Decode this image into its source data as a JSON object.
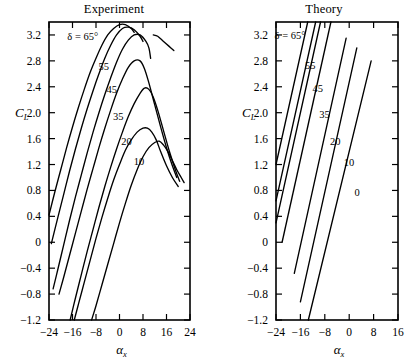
{
  "figure": {
    "background": "#ffffff",
    "ink_color": "#000000"
  },
  "chart_data": [
    {
      "type": "line",
      "title": "Experiment",
      "xlabel": "αₓ",
      "ylabel": "Cₗ",
      "xlabel_base": "α",
      "xlabel_sub": "x",
      "ylabel_base": "C",
      "ylabel_sub": "L",
      "xlim": [
        -24,
        24
      ],
      "ylim": [
        -1.2,
        3.4
      ],
      "xticks": [
        -24,
        -16,
        -8,
        0,
        8,
        16,
        24
      ],
      "xticklabels": [
        "−24",
        "−16",
        "−8",
        "0",
        "8",
        "16",
        "24"
      ],
      "yticks": [
        -1.2,
        -0.8,
        -0.4,
        0,
        0.4,
        0.8,
        1.2,
        1.6,
        2.0,
        2.4,
        2.8,
        3.2
      ],
      "yticklabels": [
        "−1.2",
        "−0.8",
        "−0.4",
        "0",
        "0.4",
        "0.8",
        "1.2",
        "1.6",
        "2.0",
        "2.4",
        "2.8",
        "3.2"
      ],
      "grid": false,
      "legend_position": "inline-annotations",
      "annotation_delta": "δ = 65°",
      "series": [
        {
          "name": "65",
          "label": "δ = 65°",
          "points": [
            [
              -24,
              0.42
            ],
            [
              -22,
              0.78
            ],
            [
              -20,
              1.12
            ],
            [
              -18,
              1.46
            ],
            [
              -16,
              1.78
            ],
            [
              -14,
              2.08
            ],
            [
              -12,
              2.36
            ],
            [
              -10,
              2.62
            ],
            [
              -8,
              2.84
            ],
            [
              -6,
              3.04
            ],
            [
              -4,
              3.2
            ],
            [
              -2,
              3.3
            ],
            [
              0,
              3.36
            ],
            [
              2,
              3.36
            ],
            [
              4,
              3.3
            ],
            [
              5,
              3.24
            ]
          ]
        },
        {
          "name": "55",
          "label": "55",
          "points": [
            [
              -23.2,
              -0.02
            ],
            [
              -21,
              0.38
            ],
            [
              -19,
              0.74
            ],
            [
              -17,
              1.1
            ],
            [
              -15,
              1.44
            ],
            [
              -13,
              1.76
            ],
            [
              -11,
              2.06
            ],
            [
              -9,
              2.34
            ],
            [
              -7,
              2.6
            ],
            [
              -5,
              2.84
            ],
            [
              -3,
              3.04
            ],
            [
              -1,
              3.2
            ],
            [
              1,
              3.3
            ],
            [
              3,
              3.32
            ],
            [
              5,
              3.28
            ],
            [
              7,
              3.18
            ],
            [
              8,
              3.1
            ]
          ]
        },
        {
          "name": "45",
          "label": "45",
          "points": [
            [
              -22.6,
              -0.72
            ],
            [
              -21,
              -0.42
            ],
            [
              -19,
              -0.04
            ],
            [
              -17,
              0.34
            ],
            [
              -15,
              0.7
            ],
            [
              -13,
              1.04
            ],
            [
              -11,
              1.38
            ],
            [
              -9,
              1.7
            ],
            [
              -7,
              2.0
            ],
            [
              -5,
              2.28
            ],
            [
              -3,
              2.54
            ],
            [
              -1,
              2.78
            ],
            [
              1,
              2.98
            ],
            [
              3,
              3.12
            ],
            [
              5,
              3.2
            ],
            [
              7,
              3.2
            ],
            [
              9,
              3.1
            ],
            [
              10,
              3.0
            ],
            [
              10.6,
              2.84
            ]
          ]
        },
        {
          "name": "45b",
          "label": "",
          "points": [
            [
              11.5,
              3.2
            ],
            [
              13,
              3.18
            ],
            [
              15,
              3.1
            ],
            [
              17,
              3.02
            ],
            [
              18.5,
              2.96
            ]
          ]
        },
        {
          "name": "35",
          "label": "35",
          "points": [
            [
              -20.6,
              -0.8
            ],
            [
              -19,
              -0.54
            ],
            [
              -17,
              -0.2
            ],
            [
              -15,
              0.14
            ],
            [
              -13,
              0.48
            ],
            [
              -11,
              0.82
            ],
            [
              -9,
              1.14
            ],
            [
              -7,
              1.46
            ],
            [
              -5,
              1.76
            ],
            [
              -3,
              2.04
            ],
            [
              -1,
              2.3
            ],
            [
              1,
              2.52
            ],
            [
              3,
              2.7
            ],
            [
              5,
              2.8
            ],
            [
              7,
              2.8
            ],
            [
              8.5,
              2.68
            ],
            [
              10,
              2.46
            ],
            [
              12,
              2.12
            ],
            [
              14,
              1.78
            ],
            [
              16,
              1.46
            ],
            [
              18,
              1.18
            ],
            [
              19.5,
              1.0
            ]
          ]
        },
        {
          "name": "20",
          "label": "20",
          "points": [
            [
              -16.8,
              -1.2
            ],
            [
              -15,
              -0.86
            ],
            [
              -13,
              -0.5
            ],
            [
              -11,
              -0.14
            ],
            [
              -9,
              0.2
            ],
            [
              -7,
              0.54
            ],
            [
              -5,
              0.86
            ],
            [
              -3,
              1.16
            ],
            [
              -1,
              1.44
            ],
            [
              1,
              1.7
            ],
            [
              3,
              1.94
            ],
            [
              5,
              2.14
            ],
            [
              7,
              2.3
            ],
            [
              8.5,
              2.38
            ],
            [
              10,
              2.36
            ],
            [
              11.5,
              2.24
            ],
            [
              13,
              2.04
            ],
            [
              15,
              1.72
            ],
            [
              17,
              1.4
            ],
            [
              19,
              1.12
            ],
            [
              20.5,
              0.94
            ]
          ]
        },
        {
          "name": "10",
          "label": "10",
          "points": [
            [
              -15.4,
              -1.2
            ],
            [
              -14,
              -0.96
            ],
            [
              -12,
              -0.62
            ],
            [
              -10,
              -0.28
            ],
            [
              -8,
              0.06
            ],
            [
              -6,
              0.38
            ],
            [
              -4,
              0.68
            ],
            [
              -2,
              0.96
            ],
            [
              0,
              1.2
            ],
            [
              2,
              1.42
            ],
            [
              4,
              1.58
            ],
            [
              6,
              1.7
            ],
            [
              8,
              1.76
            ],
            [
              9.5,
              1.76
            ],
            [
              11,
              1.7
            ],
            [
              12.5,
              1.58
            ],
            [
              14,
              1.4
            ],
            [
              16,
              1.18
            ],
            [
              18,
              1.0
            ],
            [
              20,
              0.86
            ]
          ]
        },
        {
          "name": "0",
          "label": "",
          "points": [
            [
              -9.5,
              -1.2
            ],
            [
              -8,
              -0.98
            ],
            [
              -6,
              -0.66
            ],
            [
              -4,
              -0.34
            ],
            [
              -2,
              -0.02
            ],
            [
              0,
              0.3
            ],
            [
              2,
              0.6
            ],
            [
              4,
              0.88
            ],
            [
              6,
              1.12
            ],
            [
              8,
              1.32
            ],
            [
              10,
              1.46
            ],
            [
              12,
              1.54
            ],
            [
              13.5,
              1.56
            ],
            [
              15,
              1.5
            ],
            [
              16.5,
              1.4
            ],
            [
              18,
              1.26
            ],
            [
              19.5,
              1.12
            ],
            [
              21,
              1.0
            ],
            [
              22,
              0.92
            ]
          ]
        }
      ],
      "curve_labels": [
        {
          "text": "δ = 65°",
          "x": -12.5,
          "y": 3.12
        },
        {
          "text": "55",
          "x": -5.4,
          "y": 2.66
        },
        {
          "text": "45",
          "x": -2.6,
          "y": 2.3
        },
        {
          "text": "35",
          "x": -0.4,
          "y": 1.88
        },
        {
          "text": "20",
          "x": 2.4,
          "y": 1.5
        },
        {
          "text": "10",
          "x": 6.6,
          "y": 1.2
        }
      ]
    },
    {
      "type": "line",
      "title": "Theory",
      "xlabel": "αₓ",
      "ylabel": "Cₗ",
      "xlabel_base": "α",
      "xlabel_sub": "x",
      "ylabel_base": "C",
      "ylabel_sub": "L",
      "xlim": [
        -24,
        16
      ],
      "ylim": [
        -1.2,
        3.4
      ],
      "xticks": [
        -24,
        -16,
        -8,
        0,
        8,
        16
      ],
      "xticklabels": [
        "−24",
        "−16",
        "−8",
        "0",
        "8",
        "16"
      ],
      "yticks": [
        -1.2,
        -0.8,
        -0.4,
        0,
        0.4,
        0.8,
        1.2,
        1.6,
        2.0,
        2.4,
        2.8,
        3.2
      ],
      "yticklabels": [
        "−1.2",
        "−0.8",
        "−0.4",
        "0",
        "0.4",
        "0.8",
        "1.2",
        "1.6",
        "2.0",
        "2.4",
        "2.8",
        "3.2"
      ],
      "grid": false,
      "legend_position": "inline-annotations",
      "annotation_delta": "δ = 65°",
      "series": [
        {
          "name": "65",
          "label": "δ = 65°",
          "points": [
            [
              -24,
              1.2
            ],
            [
              -13.6,
              3.4
            ]
          ]
        },
        {
          "name": "55",
          "label": "55",
          "points": [
            [
              -24,
              0.64
            ],
            [
              -11,
              3.4
            ]
          ]
        },
        {
          "name": "45",
          "label": "45",
          "points": [
            [
              -24,
              0.3
            ],
            [
              -9.4,
              3.4
            ]
          ]
        },
        {
          "name": "35",
          "label": "35",
          "points": [
            [
              -22,
              0.0
            ],
            [
              -6,
              3.4
            ]
          ]
        },
        {
          "name": "20",
          "label": "20",
          "points": [
            [
              -18,
              -0.48
            ],
            [
              -1,
              3.15
            ]
          ]
        },
        {
          "name": "10",
          "label": "10",
          "points": [
            [
              -16,
              -0.92
            ],
            [
              2.5,
              3.0
            ]
          ]
        },
        {
          "name": "0",
          "label": "0",
          "points": [
            [
              -13.4,
              -1.2
            ],
            [
              7.2,
              2.8
            ]
          ]
        }
      ],
      "curve_labels": [
        {
          "text": "δ = 65°",
          "x": -19.4,
          "y": 3.14
        },
        {
          "text": "55",
          "x": -12.8,
          "y": 2.68
        },
        {
          "text": "45",
          "x": -10.3,
          "y": 2.32
        },
        {
          "text": "35",
          "x": -8.1,
          "y": 1.92
        },
        {
          "text": "20",
          "x": -4.6,
          "y": 1.5
        },
        {
          "text": "10",
          "x": -0.1,
          "y": 1.18
        },
        {
          "text": "0",
          "x": 2.6,
          "y": 0.72
        }
      ]
    }
  ]
}
